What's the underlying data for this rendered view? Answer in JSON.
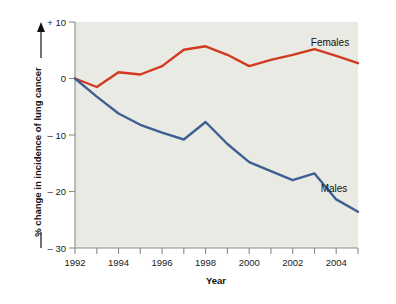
{
  "chart_data": {
    "type": "line",
    "title": "",
    "xlabel": "Year",
    "ylabel": "% change in incidence of lung cancer",
    "x": [
      1992,
      1993,
      1994,
      1995,
      1996,
      1997,
      1998,
      1999,
      2000,
      2001,
      2002,
      2003,
      2004,
      2005
    ],
    "xlim": [
      1992,
      2005
    ],
    "ylim": [
      -30,
      10
    ],
    "xticks_major": [
      1992,
      1994,
      1996,
      1998,
      2000,
      2002,
      2004
    ],
    "xtick_labels": [
      "1992",
      "1994",
      "1996",
      "1998",
      "2000",
      "2002",
      "2004"
    ],
    "xticks_minor": [
      1993,
      1995,
      1997,
      1999,
      2001,
      2003,
      2005
    ],
    "yticks": [
      10,
      0,
      -10,
      -20,
      -30
    ],
    "ytick_labels": [
      "+ 10",
      "0",
      "– 10",
      "– 20",
      "– 30"
    ],
    "grid": false,
    "legend_position": "inline-right",
    "series": [
      {
        "name": "Females",
        "color": "#d2391f",
        "values": [
          0.0,
          -1.5,
          1.1,
          0.7,
          2.2,
          5.1,
          5.7,
          4.2,
          2.2,
          3.3,
          4.2,
          5.2,
          4.0,
          2.7
        ],
        "label_text": "Females"
      },
      {
        "name": "Males",
        "color": "#3e5f91",
        "values": [
          0.0,
          -3.2,
          -6.2,
          -8.2,
          -9.6,
          -10.8,
          -7.7,
          -11.6,
          -14.8,
          -16.4,
          -18.0,
          -16.8,
          -21.4,
          -23.6
        ],
        "label_text": "Males"
      }
    ]
  },
  "axes": {
    "y_axis_title": "% change in incidence of lung cancer",
    "x_axis_title": "Year",
    "y_positive_arrow": "up-arrow-icon",
    "y_negative_dash": "minus-dash-icon"
  },
  "colors": {
    "females_line": "#d2391f",
    "males_line": "#3e5f91",
    "plot_background": "#e9eae4",
    "axis": "#8b8b86",
    "page_background": "#ffffff",
    "text": "#111111"
  }
}
